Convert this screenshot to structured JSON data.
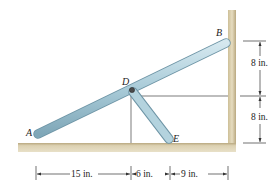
{
  "diagram": {
    "points": {
      "A": {
        "label": "A"
      },
      "B": {
        "label": "B"
      },
      "D": {
        "label": "D"
      },
      "E": {
        "label": "E"
      }
    },
    "members": [
      {
        "name": "bar-AB",
        "from": "A",
        "to": "B"
      },
      {
        "name": "bar-DE",
        "from": "D",
        "to": "E"
      }
    ],
    "dimensions": {
      "horizontal": [
        {
          "label": "15 in."
        },
        {
          "label": "6 in."
        },
        {
          "label": "9 in."
        }
      ],
      "vertical": [
        {
          "label": "8 in."
        },
        {
          "label": "8 in."
        }
      ]
    },
    "colors": {
      "bar_fill": "#a9cbd8",
      "bar_edge": "#6e95a6",
      "ground": "#d6c9a3",
      "ground_shade": "#bfae84",
      "line": "#333333"
    }
  }
}
